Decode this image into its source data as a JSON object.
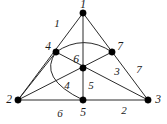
{
  "figure": {
    "type": "graph-diagram",
    "background_color": "#ffffff",
    "stroke_color": "#2b2b2b",
    "vertex_color": "#000000"
  },
  "vertices": [
    {
      "id": "v1",
      "label": "1",
      "x": 83,
      "y": 13,
      "label_x": 83,
      "label_y": 8,
      "label_anchor": "middle"
    },
    {
      "id": "v2",
      "label": "2",
      "x": 18,
      "y": 100,
      "label_x": 9,
      "label_y": 103,
      "label_anchor": "middle"
    },
    {
      "id": "v3",
      "label": "3",
      "x": 148,
      "y": 100,
      "label_x": 158,
      "label_y": 103,
      "label_anchor": "middle"
    },
    {
      "id": "v4",
      "label": "4",
      "x": 56,
      "y": 52,
      "label_x": 48,
      "label_y": 50,
      "label_anchor": "middle"
    },
    {
      "id": "v5",
      "label": "5",
      "x": 83,
      "y": 100,
      "label_x": 83,
      "label_y": 116,
      "label_anchor": "middle"
    },
    {
      "id": "v6",
      "label": "6",
      "x": 83,
      "y": 68,
      "label_x": 76,
      "label_y": 63,
      "label_anchor": "middle"
    },
    {
      "id": "v7",
      "label": "7",
      "x": 112,
      "y": 52,
      "label_x": 120,
      "label_y": 50,
      "label_anchor": "middle"
    }
  ],
  "edge_labels": [
    {
      "id": "e1",
      "label": "1",
      "x": 57,
      "y": 27
    },
    {
      "id": "e7",
      "label": "7",
      "x": 139,
      "y": 73
    },
    {
      "id": "e3",
      "label": "3",
      "x": 117,
      "y": 75
    },
    {
      "id": "e5",
      "label": "5",
      "x": 91,
      "y": 89
    },
    {
      "id": "e4",
      "label": "4",
      "x": 67,
      "y": 89
    },
    {
      "id": "e2",
      "label": "2",
      "x": 124,
      "y": 114
    },
    {
      "id": "e6",
      "label": "6",
      "x": 60,
      "y": 117
    }
  ],
  "edges": [
    {
      "id": "edge-1-2",
      "kind": "line",
      "from": "v1",
      "to": "v2",
      "d": "M 83 13 L 18 100"
    },
    {
      "id": "edge-1-3",
      "kind": "line",
      "from": "v1",
      "to": "v3",
      "d": "M 83 13 L 148 100"
    },
    {
      "id": "edge-2-3",
      "kind": "line",
      "from": "v2",
      "to": "v3",
      "d": "M 18 100 L 148 100"
    },
    {
      "id": "edge-1-5",
      "kind": "line",
      "from": "v1",
      "to": "v5",
      "d": "M 83 13 L 83 100"
    },
    {
      "id": "edge-4-3",
      "kind": "line",
      "from": "v4",
      "to": "v3",
      "d": "M 56 52 L 148 100"
    },
    {
      "id": "edge-2-7",
      "kind": "line",
      "from": "v2",
      "to": "v7",
      "d": "M 18 100 L 112 52"
    },
    {
      "id": "edge-2-4",
      "kind": "line",
      "from": "v2",
      "to": "v4",
      "d": "M 18 100 L 56 52"
    },
    {
      "id": "arc-4-7",
      "kind": "arc",
      "from": "v4",
      "to": "v7",
      "d": "M 56 52 Q 84 33 112 52"
    },
    {
      "id": "arc-4-5",
      "kind": "arc",
      "from": "v4",
      "to": "v5",
      "d": "M 56 52 Q 37 78 83 100"
    }
  ],
  "legend": {
    "vertex_ids": [
      "1",
      "2",
      "3",
      "4",
      "5",
      "6",
      "7"
    ],
    "edge_ids": [
      "1",
      "2",
      "3",
      "4",
      "5",
      "6",
      "7"
    ]
  }
}
